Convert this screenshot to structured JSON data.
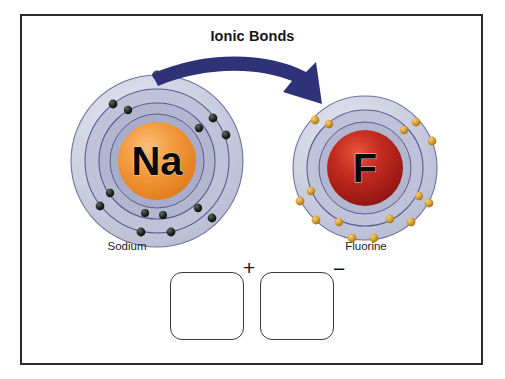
{
  "diagram": {
    "title": "Ionic Bonds",
    "type": "ionic-bond-electron-transfer",
    "frame": {
      "border_color": "#2b2b2b",
      "background": "#ffffff"
    },
    "arrow": {
      "name": "electron-transfer-arrow",
      "color": "#2e3277",
      "direction": "sodium-to-fluorine",
      "meaning": "transfer of one valence electron"
    },
    "atoms": [
      {
        "symbol": "Na",
        "label": "Sodium",
        "nucleus_color": "#ef8f32",
        "nucleus_highlight": "#f7b46b",
        "electron_color": "#17231b",
        "shell_fill": "#c6c8dc",
        "shell_stroke": "#4b4f86",
        "shells": [
          2,
          8,
          1
        ],
        "valence_electrons": 1,
        "role": "electron-donor"
      },
      {
        "symbol": "F",
        "label": "Fluorine",
        "nucleus_color": "#b4231d",
        "nucleus_highlight": "#e4432c",
        "electron_color": "#cf9a28",
        "shell_fill": "#c6c8dc",
        "shell_stroke": "#4b4f86",
        "shells": [
          2,
          7
        ],
        "valence_electrons": 7,
        "role": "electron-acceptor"
      }
    ],
    "ions": [
      {
        "symbol": "Na",
        "charge": "+",
        "nucleus_color": "#ef8f32",
        "electron_color": "#17231b",
        "box_label": "sodium-cation"
      },
      {
        "symbol": "F",
        "charge": "−",
        "nucleus_color": "#b4231d",
        "electron_color": "#cf9a28",
        "box_label": "fluoride-anion"
      }
    ]
  }
}
